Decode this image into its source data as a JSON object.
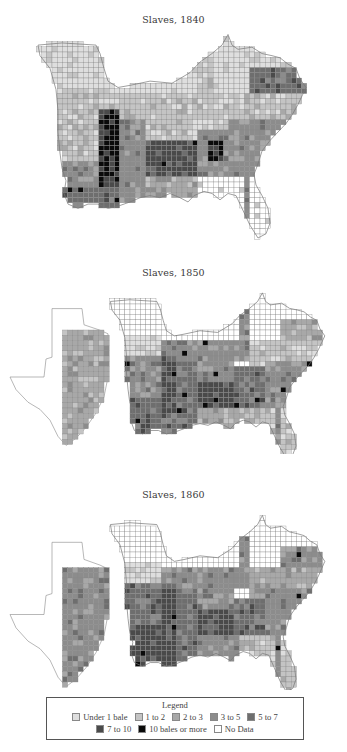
{
  "maps": [
    {
      "title": "Slaves, 1840",
      "year": 1840,
      "region_classes": {
        "missouri_north": 0,
        "missouri": 1,
        "arkansas": 1,
        "louisiana_north": 3,
        "louisiana_delta": 4,
        "mississippi_delta": 6,
        "mississippi": 3,
        "tennessee": 1,
        "kentucky": 0,
        "alabama_north": 1,
        "alabama_black_belt": 5,
        "alabama_south": 2,
        "georgia": 3,
        "georgia_hotspot": 6,
        "south_carolina": 3,
        "north_carolina": 1,
        "virginia": 0,
        "virginia_south": 4,
        "florida": 0,
        "texas": 7
      }
    },
    {
      "title": "Slaves, 1850",
      "year": 1850,
      "region_classes": {
        "missouri_north": 0,
        "missouri": 0,
        "arkansas": 3,
        "louisiana_north": 4,
        "louisiana_delta": 4,
        "mississippi_delta": 5,
        "mississippi": 4,
        "tennessee": 3,
        "kentucky": 0,
        "alabama_north": 3,
        "alabama_black_belt": 5,
        "alabama_south": 2,
        "georgia": 4,
        "georgia_hotspot": 4,
        "south_carolina": 3,
        "north_carolina": 1,
        "virginia": 0,
        "virginia_south": 2,
        "florida": 1,
        "texas": 2
      }
    },
    {
      "title": "Slaves, 1860",
      "year": 1860,
      "region_classes": {
        "missouri_north": 0,
        "missouri": 0,
        "arkansas": 4,
        "louisiana_north": 5,
        "louisiana_delta": 5,
        "mississippi_delta": 5,
        "mississippi": 4,
        "tennessee": 3,
        "kentucky": 0,
        "alabama_north": 3,
        "alabama_black_belt": 5,
        "alabama_south": 3,
        "georgia": 4,
        "georgia_hotspot": 4,
        "south_carolina": 3,
        "north_carolina": 2,
        "virginia": 0,
        "virginia_south": 3,
        "florida": 1,
        "texas": 3
      }
    }
  ],
  "legend": {
    "title": "Legend",
    "items": [
      {
        "label": "Under 1 bale",
        "color": "#dedede"
      },
      {
        "label": "1 to 2",
        "color": "#c4c4c4"
      },
      {
        "label": "2 to 3",
        "color": "#a8a8a8"
      },
      {
        "label": "3 to 5",
        "color": "#8c8c8c"
      },
      {
        "label": "5 to 7",
        "color": "#6e6e6e"
      },
      {
        "label": "7 to 10",
        "color": "#4a4a4a"
      },
      {
        "label": "10 bales or more",
        "color": "#0a0a0a"
      },
      {
        "label": "No Data",
        "color": "#ffffff"
      }
    ]
  }
}
